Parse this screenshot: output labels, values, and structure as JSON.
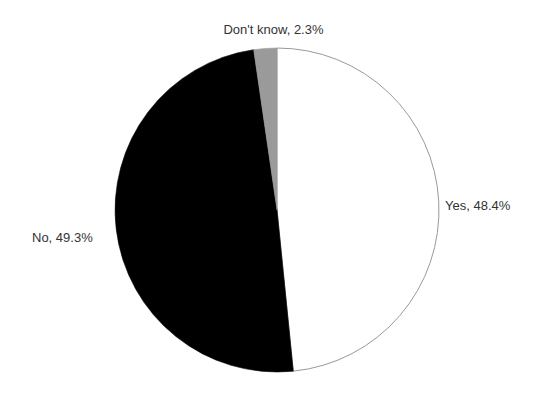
{
  "chart_data": {
    "type": "pie",
    "title": "",
    "labels": [
      "Yes",
      "No",
      "Don't know"
    ],
    "values": [
      48.4,
      49.3,
      2.3
    ],
    "value_unit": "%",
    "data_labels": [
      "Yes, 48.4%",
      "No, 49.3%",
      "Don't know, 2.3%"
    ],
    "colors": [
      "#ffffff",
      "#000000",
      "#9a9a9a"
    ],
    "slice_outline_color": "#999999",
    "start_angle_deg": 0,
    "direction": "clockwise",
    "legend": "none",
    "label_position": "outside",
    "grid": false,
    "background": "#ffffff",
    "text_color": "#333333"
  },
  "labels": {
    "yes": "Yes, 48.4%",
    "no": "No, 49.3%",
    "dont_know": "Don't know, 2.3%"
  }
}
